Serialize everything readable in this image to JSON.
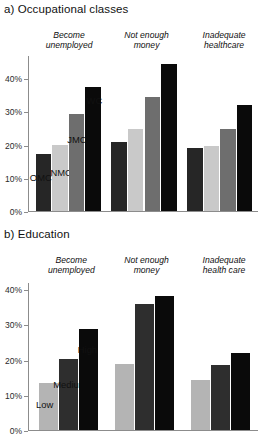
{
  "chart_data": [
    {
      "type": "bar",
      "title": "a) Occupational classes",
      "panel_id": "a",
      "xlabel": "",
      "ylabel": "",
      "ylim": [
        0,
        47
      ],
      "grid": false,
      "legend_position": "inline-above-first-group",
      "ytick_labels": [
        "0%",
        "10%",
        "20%",
        "30%",
        "40%"
      ],
      "ytick_values": [
        0,
        10,
        20,
        30,
        40
      ],
      "categories": [
        "Become\nunemployed",
        "Not enough\nmoney",
        "Inadequate\nhealthcare"
      ],
      "series": [
        {
          "name": "OMC",
          "color": "#262626",
          "values": [
            17.3,
            21.0,
            19.0
          ]
        },
        {
          "name": "NMC",
          "color": "#c9c9c9",
          "values": [
            20.0,
            25.0,
            19.6
          ]
        },
        {
          "name": "JMC",
          "color": "#6e6e6e",
          "values": [
            29.5,
            34.6,
            24.8
          ]
        },
        {
          "name": "WC",
          "color": "#0a0a0a",
          "values": [
            37.6,
            44.5,
            32.2
          ]
        }
      ]
    },
    {
      "type": "bar",
      "title": "b) Education",
      "panel_id": "b",
      "xlabel": "",
      "ylabel": "",
      "ylim": [
        0,
        42
      ],
      "grid": false,
      "legend_position": "inline-above-first-group",
      "ytick_labels": [
        "0%",
        "10%",
        "20%",
        "30%",
        "40%"
      ],
      "ytick_values": [
        0,
        10,
        20,
        30,
        40
      ],
      "categories": [
        "Become\nunemployed",
        "Not enough\nmoney",
        "Inadequate\nhealth care"
      ],
      "series": [
        {
          "name": "Low",
          "color": "#b4b4b4",
          "values": [
            13.4,
            18.9,
            14.4
          ]
        },
        {
          "name": "Medium",
          "color": "#2e2e2e",
          "values": [
            20.3,
            36.0,
            18.7
          ]
        },
        {
          "name": "High",
          "color": "#0a0a0a",
          "values": [
            29.0,
            38.3,
            22.0
          ]
        }
      ]
    }
  ]
}
